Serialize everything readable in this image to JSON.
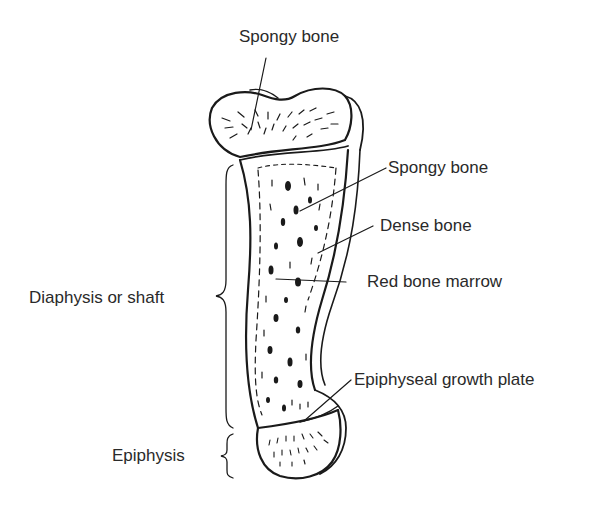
{
  "diagram": {
    "labels": {
      "spongy_bone_top": "Spongy bone",
      "spongy_bone_shaft": "Spongy bone",
      "dense_bone": "Dense bone",
      "red_bone_marrow": "Red bone marrow",
      "epiphyseal_growth_plate": "Epiphyseal growth plate",
      "diaphysis": "Diaphysis or shaft",
      "epiphysis": "Epiphysis"
    },
    "colors": {
      "ink": "#1a1a1a",
      "text": "#2a2a2a",
      "background": "#ffffff"
    }
  }
}
